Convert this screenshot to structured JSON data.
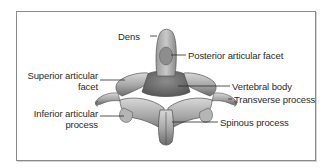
{
  "figure": {
    "labels": {
      "dens": "Dens",
      "posterior_articular_facet": "Posterior articular facet",
      "superior_articular_facet_line1": "Superior articular",
      "superior_articular_facet_line2": "facet",
      "vertebral_body": "Vertebral body",
      "transverse_process": "Transverse process",
      "inferior_articular_process_line1": "Inferior articular",
      "inferior_articular_process_line2": "process",
      "spinous_process": "Spinous process"
    },
    "colors": {
      "border": "#8a8a8a",
      "bone_light": "#cfcfcf",
      "bone_mid": "#9c9c9c",
      "bone_dark": "#5e5e5e",
      "leader_line": "#2a2a2a",
      "text": "#2a2a2a"
    }
  }
}
